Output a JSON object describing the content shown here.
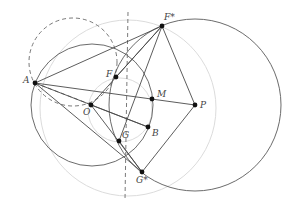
{
  "figure": {
    "width": 292,
    "height": 213,
    "background": "#ffffff",
    "colors": {
      "dark_stroke": "#5a5a5a",
      "light_stroke": "#dcdcdc",
      "point_fill": "#111111",
      "label": "#444444"
    }
  },
  "points": {
    "A": {
      "label": "A",
      "x": 35,
      "y": 83,
      "lx": -12,
      "ly": 0
    },
    "F*": {
      "label": "F*",
      "x": 162,
      "y": 26,
      "lx": 2,
      "ly": -6
    },
    "F": {
      "label": "F",
      "x": 116,
      "y": 77,
      "lx": -10,
      "ly": 0
    },
    "M": {
      "label": "M",
      "x": 152,
      "y": 99,
      "lx": 5,
      "ly": -2
    },
    "P": {
      "label": "P",
      "x": 195,
      "y": 105,
      "lx": 5,
      "ly": 3
    },
    "O": {
      "label": "O",
      "x": 91,
      "y": 105,
      "lx": -8,
      "ly": 10
    },
    "B": {
      "label": "B",
      "x": 148,
      "y": 127,
      "lx": 4,
      "ly": 9
    },
    "G": {
      "label": "G",
      "x": 119,
      "y": 141,
      "lx": 3,
      "ly": -3
    },
    "G*": {
      "label": "G*",
      "x": 142,
      "y": 172,
      "lx": -6,
      "ly": 11
    }
  },
  "circles": [
    {
      "name": "circle-centered-p",
      "cx": 195,
      "cy": 105,
      "r": 86,
      "style": "dark"
    },
    {
      "name": "circle-centered-o",
      "cx": 92,
      "cy": 105,
      "r": 61,
      "style": "dark"
    },
    {
      "name": "dashed-circle",
      "cx": 73,
      "cy": 62,
      "r": 44,
      "style": "dash"
    },
    {
      "name": "light-circle-large",
      "cx": 128,
      "cy": 108,
      "r": 88,
      "style": "light"
    },
    {
      "name": "light-circle-small",
      "cx": 120,
      "cy": 110,
      "r": 32,
      "style": "light"
    }
  ],
  "segments": [
    [
      "A",
      "F*"
    ],
    [
      "A",
      "P"
    ],
    [
      "A",
      "G*"
    ],
    [
      "A",
      "B"
    ],
    [
      "O",
      "F*"
    ],
    [
      "O",
      "G*"
    ],
    [
      "O",
      "B"
    ],
    [
      "F",
      "F*"
    ],
    [
      "F*",
      "P"
    ],
    [
      "P",
      "G*"
    ],
    [
      "G",
      "G*"
    ],
    [
      "F*",
      "G"
    ]
  ],
  "dashed_lines": [
    {
      "from": [
        35,
        83
      ],
      "to": [
        92,
        105
      ]
    },
    {
      "from": [
        128,
        12
      ],
      "to": [
        125,
        200
      ]
    }
  ]
}
